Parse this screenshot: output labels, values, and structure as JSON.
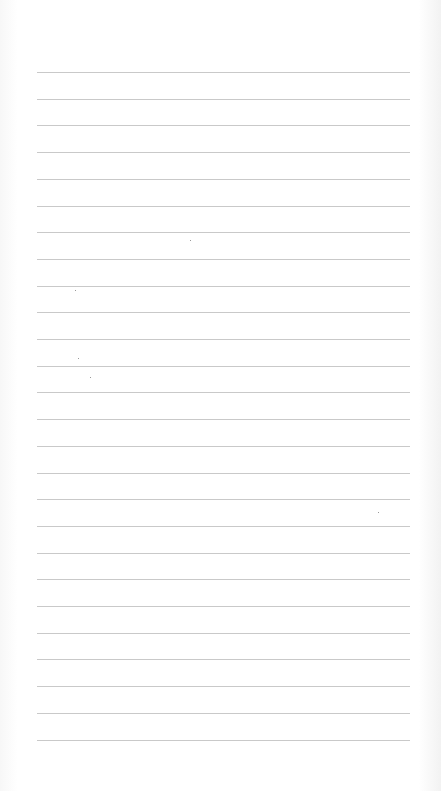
{
  "page": {
    "type": "lined-paper",
    "rule_count": 26,
    "rule_color": "#c9c9c9",
    "paper_color": "#fdfdfd",
    "text": ""
  }
}
